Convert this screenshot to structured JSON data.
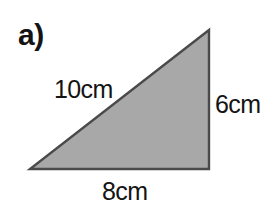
{
  "figure": {
    "part_label": "a)",
    "shape": "right-triangle",
    "fill_color": "#a8a8a8",
    "stroke_color": "#4a4a4a",
    "background_color": "#ffffff",
    "text_color": "#141414",
    "vertices": {
      "top_right": [
        209,
        30
      ],
      "bottom_right": [
        209,
        169
      ],
      "bottom_left": [
        30,
        169
      ]
    },
    "labels": {
      "hypotenuse": "10cm",
      "vertical_side": "6cm",
      "base": "8cm"
    }
  }
}
